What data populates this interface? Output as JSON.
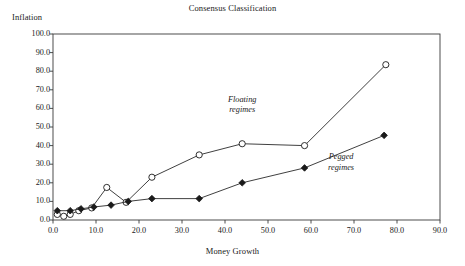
{
  "chart_data": {
    "type": "line",
    "title": "Consensus Classification",
    "xlabel": "Money Growth",
    "ylabel": "Inflation",
    "xlim": [
      0,
      90
    ],
    "ylim": [
      0,
      100
    ],
    "xticks": [
      "0.0",
      "10.0",
      "20.0",
      "30.0",
      "40.0",
      "50.0",
      "60.0",
      "70.0",
      "80.0",
      "90.0"
    ],
    "xtick_values": [
      0,
      10,
      20,
      30,
      40,
      50,
      60,
      70,
      80,
      90
    ],
    "yticks": [
      "0.0",
      "10.0",
      "20.0",
      "30.0",
      "40.0",
      "50.0",
      "60.0",
      "70.0",
      "80.0",
      "90.0",
      "100.0"
    ],
    "ytick_values": [
      0,
      10,
      20,
      30,
      40,
      50,
      60,
      70,
      80,
      90,
      100
    ],
    "grid": false,
    "legend": "inline annotations",
    "series": [
      {
        "name": "Floating regimes",
        "marker": "open-circle",
        "points": [
          [
            1.0,
            3.0
          ],
          [
            2.5,
            2.0
          ],
          [
            4.0,
            3.0
          ],
          [
            6.0,
            5.0
          ],
          [
            9.0,
            6.5
          ],
          [
            12.5,
            17.5
          ],
          [
            17.0,
            9.5
          ],
          [
            23.0,
            23.0
          ],
          [
            34.0,
            35.0
          ],
          [
            44.0,
            41.0
          ],
          [
            58.5,
            40.0
          ],
          [
            77.4,
            83.5
          ]
        ]
      },
      {
        "name": "Pegged regimes",
        "marker": "filled-diamond",
        "points": [
          [
            1.0,
            5.0
          ],
          [
            4.0,
            5.0
          ],
          [
            6.5,
            6.0
          ],
          [
            9.5,
            7.0
          ],
          [
            13.5,
            8.0
          ],
          [
            17.5,
            10.0
          ],
          [
            23.0,
            11.5
          ],
          [
            34.0,
            11.5
          ],
          [
            44.0,
            20.0
          ],
          [
            58.5,
            28.0
          ],
          [
            77.0,
            45.5
          ]
        ]
      }
    ],
    "annotations": [
      {
        "id": "floating",
        "line1": "Floating",
        "line2": "regimes",
        "x": 44.0,
        "y": 62.0
      },
      {
        "id": "pegged",
        "line1": "Pegged",
        "line2": "regimes",
        "x": 67.0,
        "y": 31.0
      }
    ],
    "colors": {
      "axis": "#3a3a3a",
      "line": "#2a2a2a",
      "marker_fill": "#ffffff",
      "marker_stroke": "#1a1a1a",
      "text": "#1a1a1a"
    }
  }
}
